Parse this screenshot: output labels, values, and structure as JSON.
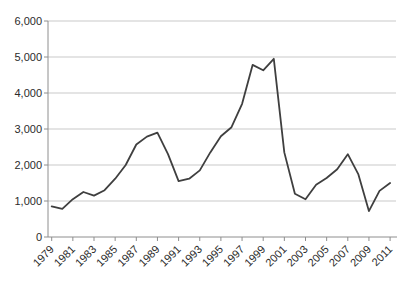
{
  "window": {
    "background": "#ffffff"
  },
  "colors": {
    "line": "#3f3f3f",
    "axis": "#8e8e8e",
    "gridline": "#c9c9c9",
    "tick_label": "#2b2b2b",
    "background": "#ffffff"
  },
  "chart_data": {
    "type": "line",
    "title": "",
    "xlabel": "",
    "ylabel": "",
    "x": [
      1979,
      1980,
      1981,
      1982,
      1983,
      1984,
      1985,
      1986,
      1987,
      1988,
      1989,
      1990,
      1991,
      1992,
      1993,
      1994,
      1995,
      1996,
      1997,
      1998,
      1999,
      2000,
      2001,
      2002,
      2003,
      2004,
      2005,
      2006,
      2007,
      2008,
      2009,
      2010,
      2011
    ],
    "values": [
      850,
      780,
      1050,
      1250,
      1150,
      1300,
      1620,
      2000,
      2570,
      2790,
      2900,
      2300,
      1550,
      1620,
      1850,
      2350,
      2800,
      3050,
      3700,
      4780,
      4630,
      4950,
      2350,
      1200,
      1050,
      1450,
      1640,
      1880,
      2300,
      1740,
      720,
      1280,
      1500
    ],
    "ylim": [
      0,
      6000
    ],
    "ytick_interval": 1000,
    "ytick_labels": [
      "0",
      "1,000",
      "2,000",
      "3,000",
      "4,000",
      "5,000",
      "6,000"
    ],
    "xtick_every_years": 2,
    "xtick_labels": [
      "1979",
      "1981",
      "1983",
      "1985",
      "1987",
      "1989",
      "1991",
      "1993",
      "1995",
      "1997",
      "1999",
      "2001",
      "2003",
      "2005",
      "2007",
      "2009",
      "2011"
    ],
    "grid": true,
    "legend": false
  }
}
